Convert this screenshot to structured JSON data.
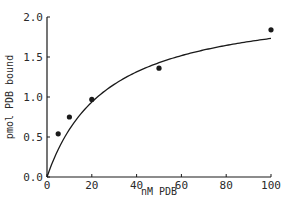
{
  "chart_data": {
    "type": "scatter",
    "title": "",
    "xlabel": "nM PDB",
    "ylabel": "pmol PDB bound",
    "xlim": [
      0,
      100
    ],
    "ylim": [
      0,
      2.0
    ],
    "x_ticks": [
      0,
      20,
      40,
      60,
      80,
      100
    ],
    "x_tick_labels": [
      "0",
      "20",
      "40",
      "60",
      "80",
      "100"
    ],
    "y_ticks": [
      0,
      0.5,
      1.0,
      1.5,
      2.0
    ],
    "y_tick_labels": [
      "0.0",
      "0.5",
      "1.0",
      "1.5",
      "2.0"
    ],
    "grid": false,
    "legend": null,
    "series": [
      {
        "name": "measured binding",
        "kind": "scatter",
        "x": [
          5,
          10,
          20,
          50,
          100
        ],
        "y": [
          0.54,
          0.75,
          0.97,
          1.36,
          1.84
        ]
      },
      {
        "name": "saturation fit",
        "kind": "line",
        "model": "Bmax*x/(Kd+x)",
        "Bmax": 2.2,
        "Kd": 27
      }
    ]
  },
  "colors": {
    "ink": "#1a1a1a",
    "background": "#ffffff"
  }
}
